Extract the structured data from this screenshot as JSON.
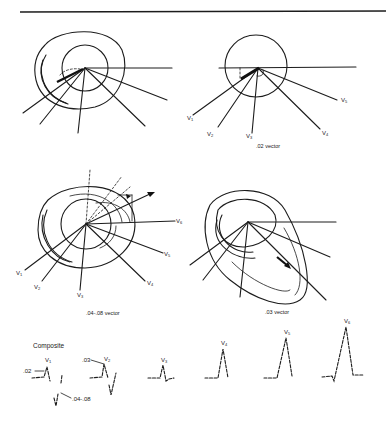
{
  "figure": {
    "panels": [
      {
        "id": "panel-top-left",
        "caption": "",
        "lead_labels": []
      },
      {
        "id": "panel-top-right",
        "caption": ".02 vector",
        "lead_labels": [
          {
            "lead": "V",
            "sub": "1"
          },
          {
            "lead": "V",
            "sub": "2"
          },
          {
            "lead": "V",
            "sub": "3"
          },
          {
            "lead": "V",
            "sub": "4"
          },
          {
            "lead": "V",
            "sub": "5"
          }
        ]
      },
      {
        "id": "panel-middle-left",
        "caption": ".04-.08 vector",
        "lead_labels": [
          {
            "lead": "V",
            "sub": "1"
          },
          {
            "lead": "V",
            "sub": "2"
          },
          {
            "lead": "V",
            "sub": "3"
          },
          {
            "lead": "V",
            "sub": "4"
          },
          {
            "lead": "V",
            "sub": "5"
          },
          {
            "lead": "V",
            "sub": "6"
          }
        ]
      },
      {
        "id": "panel-middle-right",
        "caption": ".03 vector",
        "lead_labels": []
      }
    ],
    "composite": {
      "title": "Composite",
      "tracings": [
        {
          "lead": "V",
          "sub": "1",
          "annotations": [
            ".02",
            ".04-.08"
          ]
        },
        {
          "lead": "V",
          "sub": "2",
          "annotations": [
            ".03"
          ]
        },
        {
          "lead": "V",
          "sub": "3",
          "annotations": []
        },
        {
          "lead": "V",
          "sub": "4",
          "annotations": []
        },
        {
          "lead": "V",
          "sub": "5",
          "annotations": []
        },
        {
          "lead": "V",
          "sub": "6",
          "annotations": []
        }
      ]
    }
  }
}
